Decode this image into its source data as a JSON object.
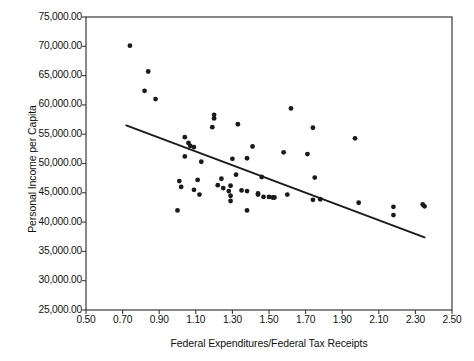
{
  "chart_data": {
    "type": "scatter",
    "title": "",
    "xlabel": "Federal Expenditures/Federal Tax Receipts",
    "ylabel": "Personal Income per Capita",
    "xlim": [
      0.5,
      2.5
    ],
    "ylim": [
      25000,
      75000
    ],
    "grid": false,
    "legend": null,
    "x_ticks": [
      "0.50",
      "0.70",
      "0.90",
      "1.10",
      "1.30",
      "1.50",
      "1.70",
      "1.90",
      "2.10",
      "2.30",
      "2.50"
    ],
    "x_tick_values": [
      0.5,
      0.7,
      0.9,
      1.1,
      1.3,
      1.5,
      1.7,
      1.9,
      2.1,
      2.3,
      2.5
    ],
    "y_ticks": [
      "25,000.00",
      "30,000.00",
      "35,000.00",
      "40,000.00",
      "45,000.00",
      "50,000.00",
      "55,000.00",
      "60,000.00",
      "65,000.00",
      "70,000.00",
      "75,000.00"
    ],
    "y_tick_values": [
      25000,
      30000,
      35000,
      40000,
      45000,
      50000,
      55000,
      60000,
      65000,
      70000,
      75000
    ],
    "marker": {
      "shape": "circle",
      "color": "#1a1a1a",
      "size": 4.4
    },
    "points": [
      [
        0.74,
        70100
      ],
      [
        0.84,
        65700
      ],
      [
        0.82,
        62400
      ],
      [
        0.88,
        61000
      ],
      [
        1.2,
        58300
      ],
      [
        1.2,
        57700
      ],
      [
        1.33,
        56700
      ],
      [
        1.19,
        56200
      ],
      [
        1.62,
        59400
      ],
      [
        1.74,
        56100
      ],
      [
        1.97,
        54300
      ],
      [
        1.04,
        54500
      ],
      [
        1.06,
        53500
      ],
      [
        1.07,
        53000
      ],
      [
        1.09,
        52800
      ],
      [
        1.41,
        52900
      ],
      [
        1.58,
        51900
      ],
      [
        1.71,
        51600
      ],
      [
        1.04,
        51200
      ],
      [
        1.13,
        50300
      ],
      [
        1.3,
        50800
      ],
      [
        1.38,
        50900
      ],
      [
        1.01,
        47000
      ],
      [
        1.11,
        47200
      ],
      [
        1.24,
        47400
      ],
      [
        1.32,
        48100
      ],
      [
        1.46,
        47700
      ],
      [
        1.22,
        46300
      ],
      [
        1.29,
        46200
      ],
      [
        1.35,
        45400
      ],
      [
        1.38,
        45300
      ],
      [
        1.44,
        44900
      ],
      [
        1.44,
        44700
      ],
      [
        1.02,
        46000
      ],
      [
        1.09,
        45500
      ],
      [
        1.12,
        44700
      ],
      [
        1.25,
        45800
      ],
      [
        1.28,
        45300
      ],
      [
        1.29,
        44500
      ],
      [
        1.29,
        43600
      ],
      [
        1.0,
        42000
      ],
      [
        1.38,
        42000
      ],
      [
        1.47,
        44300
      ],
      [
        1.5,
        44300
      ],
      [
        1.52,
        44200
      ],
      [
        1.53,
        44200
      ],
      [
        1.6,
        44700
      ],
      [
        1.74,
        43800
      ],
      [
        1.78,
        43900
      ],
      [
        1.75,
        47600
      ],
      [
        1.99,
        43300
      ],
      [
        2.18,
        42600
      ],
      [
        2.18,
        41200
      ],
      [
        2.34,
        43000
      ],
      [
        2.35,
        42700
      ]
    ],
    "trendline": {
      "type": "linear",
      "color": "#1a1a1a",
      "x_start": 0.72,
      "y_start": 56500,
      "x_end": 2.35,
      "y_end": 37400
    }
  }
}
